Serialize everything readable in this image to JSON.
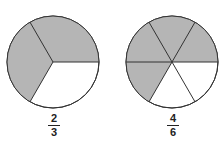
{
  "diagram": {
    "type": "fraction-circles",
    "colors": {
      "shaded": "#b5b5b5",
      "unshaded": "#ffffff",
      "stroke": "#333333"
    },
    "circles": [
      {
        "name": "thirds",
        "numerator": "2",
        "denominator": "3",
        "slices": 3,
        "shaded": 2
      },
      {
        "name": "sixths",
        "numerator": "4",
        "denominator": "6",
        "slices": 6,
        "shaded": 4
      }
    ]
  }
}
